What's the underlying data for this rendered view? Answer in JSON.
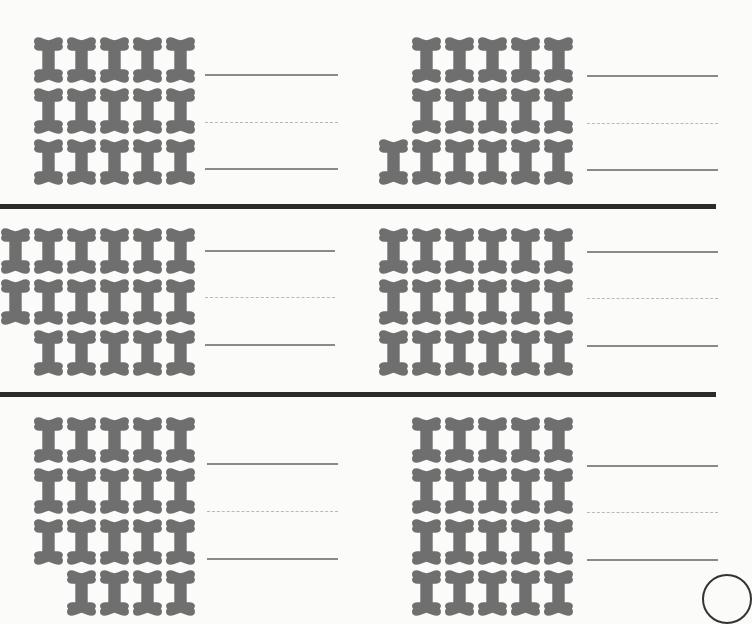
{
  "worksheet": {
    "colors": {
      "bone": "#6f6f6f",
      "separator": "#2b2b2b",
      "line": "#8a8a8a"
    },
    "icon": "dog-bone-icon",
    "panels": [
      {
        "id": "p1",
        "rows": [
          5,
          5,
          5
        ],
        "answer": ""
      },
      {
        "id": "p2",
        "rows": [
          5,
          5,
          6
        ],
        "answer": ""
      },
      {
        "id": "p3",
        "rows": [
          6,
          6,
          5
        ],
        "answer": ""
      },
      {
        "id": "p4",
        "rows": [
          6,
          6,
          6
        ],
        "answer": ""
      },
      {
        "id": "p5",
        "rows": [
          5,
          5,
          5,
          4
        ],
        "answer": ""
      },
      {
        "id": "p6",
        "rows": [
          5,
          5,
          5,
          5
        ],
        "answer": ""
      }
    ]
  }
}
